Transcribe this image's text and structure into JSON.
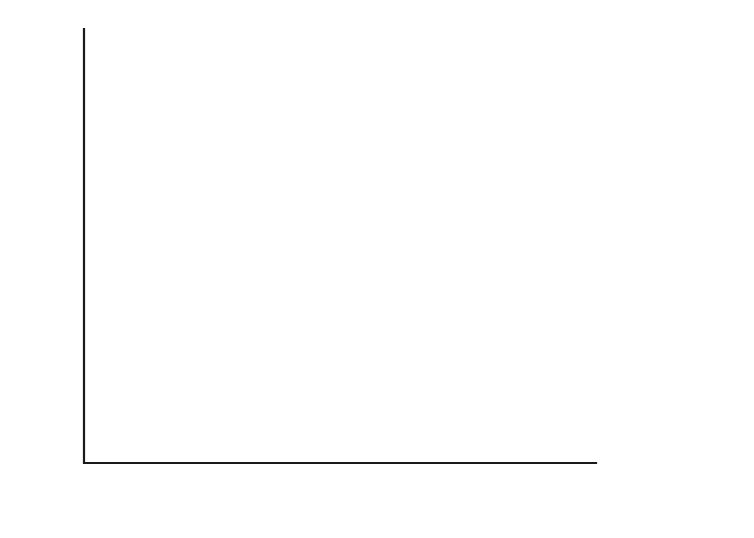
{
  "chart_data": {
    "type": "line",
    "title": "",
    "xlabel": "Inner raceway speed (×10³ rpm)",
    "ylabel": "Cage speed (×10³ rpm)",
    "xlabel_main": "Inner raceway speed (",
    "xlabel_mult": "×10",
    "xlabel_exp": "3",
    "xlabel_tail": " rpm)",
    "ylabel_main": "Cage speed (",
    "ylabel_mult": "×10",
    "ylabel_exp": "3",
    "ylabel_tail": " rpm)",
    "xlim": [
      0,
      24
    ],
    "ylim": [
      0,
      10
    ],
    "x_ticks": [
      0,
      4,
      8,
      12,
      16,
      20,
      24
    ],
    "x_tick_labels": [
      "0",
      "4",
      "8",
      "12",
      "16",
      "20",
      "24"
    ],
    "x_minor_ticks": [
      2,
      6,
      10,
      14,
      18,
      22
    ],
    "y_ticks": [
      0,
      2,
      4,
      6,
      8,
      10
    ],
    "y_tick_labels": [
      "0",
      "2",
      "4",
      "6",
      "8",
      "10"
    ],
    "y_minor_ticks": [
      1,
      3,
      5,
      7,
      9
    ],
    "grid": false,
    "legend_position": "inline-annotations",
    "series": [
      {
        "name": "Theoretical",
        "label": "Theoretical",
        "label_x": 440,
        "label_y": 50,
        "points": [
          [
            0,
            0
          ],
          [
            1.5,
            0.55
          ],
          [
            4,
            1.6
          ],
          [
            8,
            3.25
          ],
          [
            12,
            4.9
          ],
          [
            14,
            5.72
          ],
          [
            16,
            6.55
          ],
          [
            20,
            8.25
          ],
          [
            24,
            9.92
          ]
        ]
      },
      {
        "name": "Six flex rollers",
        "label": "Six flex rollers",
        "label_x": 118,
        "label_y": 286,
        "points": [
          [
            0,
            0
          ],
          [
            1.5,
            0.55
          ],
          [
            4,
            1.6
          ],
          [
            8,
            3.2
          ],
          [
            12,
            4.78
          ],
          [
            14,
            5.6
          ],
          [
            15.5,
            6.18
          ],
          [
            18,
            7.0
          ],
          [
            21,
            8.0
          ],
          [
            24,
            9.0
          ]
        ]
      },
      {
        "name": "Four flex rollers",
        "label": "Four flex rollers",
        "label_x": 580,
        "label_y": 150,
        "points": [
          [
            0,
            0
          ],
          [
            1.5,
            0.55
          ],
          [
            3.5,
            1.45
          ],
          [
            4.6,
            1.87
          ],
          [
            6,
            2.12
          ],
          [
            8,
            2.52
          ],
          [
            10,
            2.95
          ],
          [
            12,
            3.4
          ],
          [
            14,
            3.9
          ],
          [
            16,
            4.42
          ],
          [
            18,
            5.0
          ],
          [
            20,
            5.6
          ],
          [
            22,
            6.15
          ],
          [
            24,
            6.65
          ]
        ]
      },
      {
        "name": "Two flex rollers",
        "label": "Two flex rollers",
        "label_x": 520,
        "label_y": 266,
        "points": [
          [
            0,
            0
          ],
          [
            1.5,
            0.55
          ],
          [
            3.5,
            1.3
          ],
          [
            4.2,
            1.42
          ],
          [
            6,
            1.72
          ],
          [
            8,
            2.1
          ],
          [
            10,
            2.5
          ],
          [
            12,
            2.92
          ],
          [
            14,
            3.35
          ],
          [
            16,
            3.8
          ],
          [
            18,
            4.25
          ],
          [
            20,
            4.65
          ],
          [
            22,
            5.0
          ],
          [
            23,
            5.13
          ],
          [
            24,
            5.2
          ]
        ]
      },
      {
        "name": "Solid rollers",
        "label": "Solid rollers",
        "label_x": 464,
        "label_y": 382,
        "points": [
          [
            0,
            0
          ],
          [
            1.5,
            0.45
          ],
          [
            3,
            0.62
          ],
          [
            5,
            0.82
          ],
          [
            7,
            0.98
          ],
          [
            9,
            1.08
          ],
          [
            10.5,
            1.13
          ],
          [
            13,
            1.14
          ],
          [
            16,
            1.14
          ],
          [
            20,
            1.13
          ],
          [
            24,
            1.12
          ]
        ]
      }
    ],
    "colors": {
      "axis": "#1a1a1a",
      "curve": "#2b2b2b",
      "background": "#ffffff",
      "text": "#1a1a1a"
    }
  },
  "geometry": {
    "plot_left": 84,
    "plot_right": 596,
    "plot_top": 29,
    "plot_bottom": 463,
    "tick_len_major": 11,
    "tick_len_minor": 7
  }
}
